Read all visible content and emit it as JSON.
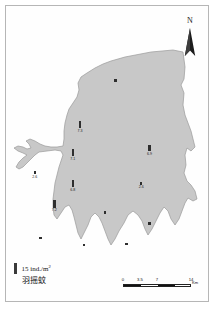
{
  "map": {
    "title": "",
    "region_fill_color": "#c8c8c8",
    "region_outline_color": "#9a9a9a",
    "background_color": "#ffffff",
    "symbol_color": "#2e2e2e"
  },
  "north_arrow": {
    "label": "N",
    "icon": "north-arrow-icon"
  },
  "legend": {
    "symbol_value_label": "15 ind./m",
    "symbol_value_superscript": "2",
    "taxon_label": "羽摇蚊",
    "symbol": "vertical-bar-symbol"
  },
  "scale_bar": {
    "ticks": [
      "0",
      "3.5",
      "7",
      "14"
    ],
    "unit": "Km"
  },
  "chart_data": {
    "type": "bar",
    "title": "",
    "xlabel": "",
    "ylabel": "ind./m2",
    "legend_position": "bottom-left",
    "units": "ind./m2",
    "reference_symbol_value": 15,
    "stations": [
      {
        "id": "S1",
        "x": 54.2,
        "y": 25.0,
        "value": 0,
        "label": "",
        "symbol": "dot"
      },
      {
        "id": "S2",
        "x": 36.8,
        "y": 39.0,
        "value": 7.3,
        "label": "7.3",
        "symbol": "bar"
      },
      {
        "id": "S3",
        "x": 33.2,
        "y": 48.5,
        "value": 7.1,
        "label": "7.1",
        "symbol": "bar"
      },
      {
        "id": "S4",
        "x": 70.8,
        "y": 47.0,
        "value": 6.9,
        "label": "6.9",
        "symbol": "bar"
      },
      {
        "id": "S5",
        "x": 33.2,
        "y": 59.0,
        "value": 6.8,
        "label": "6.8",
        "symbol": "bar"
      },
      {
        "id": "S6",
        "x": 14.6,
        "y": 56.0,
        "value": 2.6,
        "label": "2.6",
        "symbol": "bar"
      },
      {
        "id": "S7",
        "x": 66.8,
        "y": 59.5,
        "value": 2.6,
        "label": "2.6",
        "symbol": "bar"
      },
      {
        "id": "S8",
        "x": 24.2,
        "y": 65.8,
        "value": 7.2,
        "label": "7.2",
        "symbol": "bar"
      },
      {
        "id": "S9",
        "x": 49.0,
        "y": 69.5,
        "value": 0,
        "label": "",
        "symbol": "dot"
      },
      {
        "id": "S10",
        "x": 70.8,
        "y": 73.2,
        "value": 0,
        "label": "",
        "symbol": "dot"
      },
      {
        "id": "S11",
        "x": 17.4,
        "y": 78.0,
        "value": 0,
        "label": "",
        "symbol": "dot"
      },
      {
        "id": "S12",
        "x": 38.8,
        "y": 80.5,
        "value": 0,
        "label": "",
        "symbol": "dot"
      },
      {
        "id": "S13",
        "x": 59.6,
        "y": 80.0,
        "value": 0,
        "label": "",
        "symbol": "dot"
      }
    ]
  }
}
